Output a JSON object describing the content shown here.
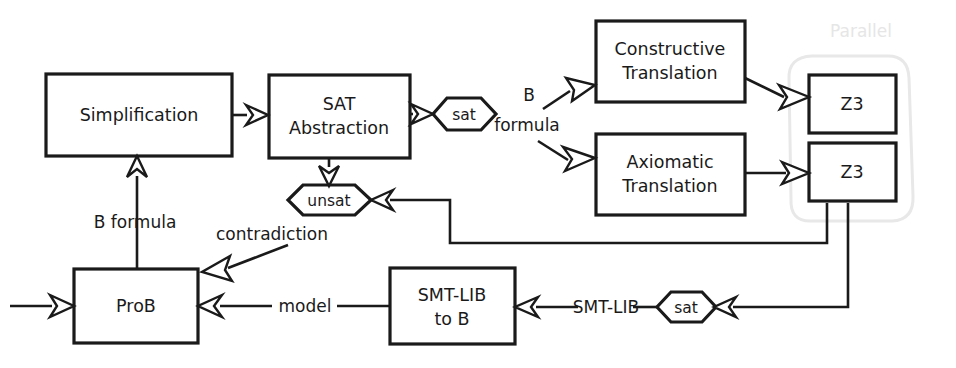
{
  "diagram": {
    "canvas": {
      "width": 956,
      "height": 368
    },
    "colors": {
      "stroke": "#1a1a1a",
      "fill": "#ffffff",
      "group_outline": "#e8e8e8",
      "group_label": "#e6e6e6"
    },
    "nodes": {
      "simplification": {
        "label": "Simplification",
        "shape": "rect"
      },
      "sat_abstraction": {
        "label_line1": "SAT",
        "label_line2": "Abstraction",
        "shape": "rect"
      },
      "constructive_translation": {
        "label_line1": "Constructive",
        "label_line2": "Translation",
        "shape": "rect"
      },
      "axiomatic_translation": {
        "label_line1": "Axiomatic",
        "label_line2": "Translation",
        "shape": "rect"
      },
      "z3_top": {
        "label": "Z3",
        "shape": "rect"
      },
      "z3_bottom": {
        "label": "Z3",
        "shape": "rect"
      },
      "prob": {
        "label": "ProB",
        "shape": "rect"
      },
      "smtlib_to_b": {
        "label_line1": "SMT-LIB",
        "label_line2": "to B",
        "shape": "rect"
      },
      "sat_top": {
        "label": "sat",
        "shape": "hexagon"
      },
      "unsat": {
        "label": "unsat",
        "shape": "hexagon"
      },
      "sat_bottom": {
        "label": "sat",
        "shape": "hexagon"
      }
    },
    "group": {
      "label": "Parallel",
      "members": [
        "z3_top",
        "z3_bottom"
      ]
    },
    "edge_labels": {
      "b_formula_top": "B",
      "b_formula_bottom": "formula",
      "b_formula_left": "B formula",
      "contradiction": "contradiction",
      "model": "model",
      "smtlib": "SMT-LIB"
    }
  }
}
